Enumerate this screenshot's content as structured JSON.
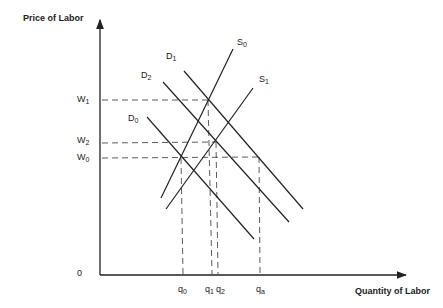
{
  "diagram": {
    "y_axis_label": "Price of Labor",
    "x_axis_label": "Quantity of Labor",
    "origin_label": "0",
    "wage_labels": [
      {
        "base": "W",
        "sub": "1"
      },
      {
        "base": "W",
        "sub": "2"
      },
      {
        "base": "W",
        "sub": "0"
      }
    ],
    "quantity_labels": [
      {
        "base": "q",
        "sub": "0"
      },
      {
        "base": "q",
        "sub": "1"
      },
      {
        "base": "q",
        "sub": "2"
      },
      {
        "base": "q",
        "sub": "a"
      }
    ],
    "curve_labels": {
      "S0": {
        "base": "S",
        "sub": "0"
      },
      "S1": {
        "base": "S",
        "sub": "1"
      },
      "D0": {
        "base": "D",
        "sub": "0"
      },
      "D1": {
        "base": "D",
        "sub": "1"
      },
      "D2": {
        "base": "D",
        "sub": "2"
      }
    },
    "line_color": "#222222"
  }
}
